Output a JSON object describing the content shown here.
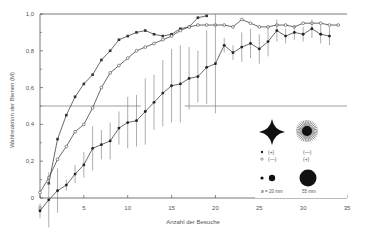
{
  "chart_data": {
    "type": "line",
    "title": "",
    "xlabel": "Anzahl der Besuche",
    "ylabel": "Wahlreaktion der Bienen (M)",
    "xlim": [
      0,
      35
    ],
    "ylim": [
      0,
      1.0
    ],
    "x_ticks": [
      0,
      5,
      10,
      15,
      20,
      25,
      30,
      35
    ],
    "y_ticks": [
      0,
      0.2,
      0.4,
      0.6,
      0.8,
      1.0
    ],
    "y_tick_labels": [
      "0",
      "0,2",
      "0,4",
      "0,6",
      "0,8",
      "1,0"
    ],
    "x_tick_labels": [
      "0",
      "5",
      "10",
      "15",
      "20",
      "25",
      "30",
      "35"
    ],
    "reference_line_y": 0.5,
    "grid": false,
    "series": [
      {
        "name": "small squares (steep)",
        "marker": "square",
        "x": [
          1,
          2,
          3,
          4,
          5,
          6,
          7,
          8,
          9,
          10,
          11,
          12,
          13,
          14,
          15,
          16,
          17,
          18,
          19
        ],
        "values": [
          0.08,
          0.32,
          0.45,
          0.55,
          0.62,
          0.67,
          0.75,
          0.8,
          0.86,
          0.88,
          0.9,
          0.91,
          0.89,
          0.88,
          0.89,
          0.92,
          0.93,
          0.98,
          0.99
        ]
      },
      {
        "name": "open circles (—)",
        "marker": "open-circle",
        "x": [
          0,
          1,
          2,
          3,
          4,
          5,
          6,
          7,
          8,
          9,
          10,
          11,
          12,
          13,
          14,
          15,
          16,
          17,
          18,
          19,
          20,
          21,
          22,
          23,
          24,
          25,
          26,
          27,
          28,
          29,
          30,
          31,
          32,
          33,
          34
        ],
        "values": [
          0.03,
          0.11,
          0.21,
          0.28,
          0.36,
          0.4,
          0.49,
          0.6,
          0.68,
          0.72,
          0.76,
          0.8,
          0.82,
          0.84,
          0.86,
          0.88,
          0.91,
          0.93,
          0.94,
          0.94,
          0.94,
          0.94,
          0.93,
          0.97,
          0.95,
          0.93,
          0.93,
          0.94,
          0.94,
          0.93,
          0.95,
          0.95,
          0.95,
          0.94,
          0.94
        ]
      },
      {
        "name": "filled dots with error bars (+)",
        "marker": "filled-circle",
        "x": [
          0,
          1,
          2,
          3,
          4,
          5,
          6,
          7,
          8,
          9,
          10,
          11,
          12,
          13,
          14,
          15,
          16,
          17,
          18,
          19,
          20,
          21,
          22,
          23,
          24,
          25,
          26,
          27,
          28,
          29,
          30,
          31,
          32,
          33
        ],
        "values": [
          -0.07,
          -0.01,
          0.04,
          0.07,
          0.13,
          0.18,
          0.27,
          0.29,
          0.31,
          0.38,
          0.41,
          0.42,
          0.47,
          0.52,
          0.57,
          0.61,
          0.62,
          0.65,
          0.66,
          0.71,
          0.73,
          0.83,
          0.79,
          0.82,
          0.84,
          0.81,
          0.85,
          0.91,
          0.88,
          0.9,
          0.89,
          0.92,
          0.89,
          0.88
        ],
        "error": [
          0.04,
          0.15,
          0.12,
          0.03,
          0.05,
          0.07,
          0.12,
          0.08,
          0.1,
          0.09,
          0.14,
          0.14,
          0.18,
          0.15,
          0.18,
          0.2,
          0.21,
          0.17,
          0.14,
          0.2,
          0.27,
          0.04,
          0.04,
          0.08,
          0.08,
          0.08,
          0.08,
          0.06,
          0.04,
          0.04,
          0.04,
          0.05,
          0.05,
          0.05
        ]
      }
    ],
    "legend": {
      "position": "lower right",
      "entries": [
        {
          "symbol": "filled-dot",
          "label": "(+)"
        },
        {
          "symbol": "open-dot",
          "label": "(—)"
        },
        {
          "symbol": "starburst",
          "label": "(—)"
        },
        {
          "symbol": "starburst",
          "label": "(+)"
        }
      ],
      "size_labels": [
        "ø = 20 mm",
        "55 mm"
      ]
    }
  }
}
